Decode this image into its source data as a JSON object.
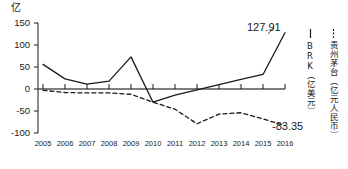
{
  "chart_data": {
    "type": "line",
    "title": "",
    "subtitle": "",
    "xlabel": "",
    "ylabel": "亿",
    "unit_label": "亿",
    "categories": [
      "2005",
      "2006",
      "2007",
      "2008",
      "2009",
      "2010",
      "2011",
      "2012",
      "2013",
      "2014",
      "2015",
      "2016"
    ],
    "x": [
      2005,
      2006,
      2007,
      2008,
      2009,
      2010,
      2011,
      2012,
      2013,
      2014,
      2015,
      2016
    ],
    "ylim": [
      -100,
      150
    ],
    "yticks": [
      150,
      100,
      50,
      0,
      -50,
      -100
    ],
    "ytick_labels": [
      "150",
      "100",
      "50",
      "0",
      "-50",
      "-100"
    ],
    "grid": false,
    "legend_position": "right-vertical",
    "zero_line": true,
    "series": [
      {
        "name": "BRK（亿美元）",
        "short_name": "BRK",
        "unit": "亿美元",
        "style": "solid",
        "color": "#1a1a1a",
        "values": [
          56,
          23,
          11,
          18,
          73,
          -30,
          -14,
          -2,
          10,
          22,
          33,
          127.91
        ],
        "last_value_label": "127.91"
      },
      {
        "name": "贵州茅台（亿元人民币）",
        "short_name": "贵州茅台",
        "unit": "亿元人民币",
        "style": "dashed",
        "color": "#1a1a1a",
        "values": [
          -3,
          -8,
          -9,
          -9,
          -12,
          -30,
          -46,
          -79,
          -57,
          -54,
          -68,
          -83.35
        ],
        "last_value_label": "-83.35"
      }
    ]
  },
  "legend": {
    "entries": [
      {
        "marker": "solid-line-icon",
        "label": "BRK（亿美元）"
      },
      {
        "marker": "dashed-line-icon",
        "label": "贵州茅台（亿元人民币）"
      }
    ]
  },
  "labels": {
    "brk_last": "127.91",
    "moutai_last": "-83.35"
  }
}
